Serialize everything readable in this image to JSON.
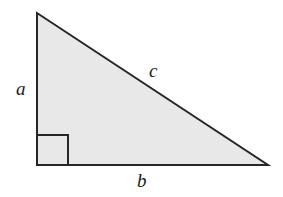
{
  "figure": {
    "name": "right-triangle-diagram",
    "shape": "right triangle",
    "background_color": "#ffffff",
    "fill_color": "#e8e8e8",
    "stroke_color": "#262626",
    "stroke_width": 2
  },
  "labels": {
    "leg_vertical": "a",
    "hypotenuse": "c",
    "leg_horizontal": "b"
  },
  "geometry": {
    "apex": {
      "x": 37,
      "y": 13
    },
    "right_angle_vertex": {
      "x": 37,
      "y": 165
    },
    "far_vertex": {
      "x": 268,
      "y": 165
    },
    "right_angle_marker": {
      "x": 37,
      "y": 135,
      "width": 31,
      "height": 30
    },
    "polygon_points": "37,13 37,165 268,165"
  },
  "label_positions": {
    "a": {
      "x": 16,
      "y": 79
    },
    "c": {
      "x": 149,
      "y": 61
    },
    "b": {
      "x": 137,
      "y": 171
    }
  }
}
